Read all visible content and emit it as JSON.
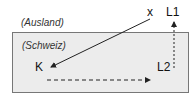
{
  "diagram": {
    "outer_region_label": "(Ausland)",
    "inner_region_label": "(Schweiz)",
    "nodes": {
      "x": "x",
      "L1": "L1",
      "L2": "L2",
      "K": "K"
    },
    "arrows": [
      {
        "from": "x",
        "to": "K",
        "style": "solid"
      },
      {
        "from": "K",
        "to": "L2",
        "style": "dashed"
      },
      {
        "from": "L2",
        "to": "L1",
        "style": "dashed"
      }
    ],
    "colors": {
      "region_fill": "#ececec",
      "border": "#777777",
      "arrow": "#222222"
    }
  }
}
